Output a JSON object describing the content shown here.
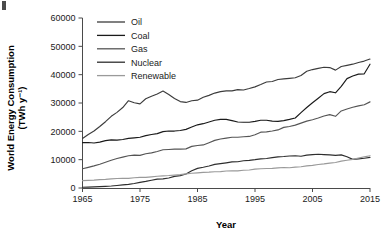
{
  "chart_data": {
    "type": "line",
    "title": "",
    "xlabel": "Year",
    "ylabel": "World Energy Consumption (TWh y⁻¹)",
    "ylabel_line1": "World Energy Consumption",
    "ylabel_line2": "(TWh y⁻¹)",
    "xlim": [
      1965,
      2015
    ],
    "ylim": [
      0,
      60000
    ],
    "xticks": [
      1965,
      1975,
      1985,
      1995,
      2005,
      2015
    ],
    "xtick_labels": [
      "1965",
      "1975",
      "1985",
      "1995",
      "2005",
      "2015"
    ],
    "yticks": [
      0,
      10000,
      20000,
      30000,
      40000,
      50000,
      60000
    ],
    "ytick_labels": [
      "0",
      "10000",
      "20000",
      "30000",
      "40000",
      "50000",
      "60000"
    ],
    "grid": false,
    "legend_position": "top-left-inside",
    "x": [
      1965,
      1966,
      1967,
      1968,
      1969,
      1970,
      1971,
      1972,
      1973,
      1974,
      1975,
      1976,
      1977,
      1978,
      1979,
      1980,
      1981,
      1982,
      1983,
      1984,
      1985,
      1986,
      1987,
      1988,
      1989,
      1990,
      1991,
      1992,
      1993,
      1994,
      1995,
      1996,
      1997,
      1998,
      1999,
      2000,
      2001,
      2002,
      2003,
      2004,
      2005,
      2006,
      2007,
      2008,
      2009,
      2010,
      2011,
      2012,
      2013,
      2014,
      2015
    ],
    "series": [
      {
        "name": "Oil",
        "color": "#3c3c3c",
        "values": [
          17500,
          18900,
          20100,
          21700,
          23400,
          25300,
          26700,
          28400,
          30800,
          30100,
          29700,
          31500,
          32400,
          33200,
          34200,
          33000,
          31600,
          30500,
          30200,
          30800,
          31000,
          32000,
          32700,
          33500,
          34000,
          34300,
          34300,
          34700,
          34600,
          35100,
          35700,
          36500,
          37400,
          37600,
          38300,
          38500,
          38700,
          38900,
          39700,
          41200,
          41800,
          42200,
          42600,
          42500,
          41600,
          42900,
          43300,
          43700,
          44300,
          44800,
          45500
        ]
      },
      {
        "name": "Coal",
        "color": "#1a1a1a",
        "values": [
          16000,
          16050,
          15900,
          16200,
          16700,
          17000,
          16900,
          17100,
          17500,
          17700,
          17900,
          18500,
          18900,
          19200,
          19900,
          20100,
          20100,
          20300,
          20700,
          21500,
          22300,
          22700,
          23300,
          23900,
          24200,
          24200,
          23800,
          23300,
          23200,
          23200,
          23500,
          23900,
          23900,
          23600,
          23500,
          23800,
          24200,
          24700,
          26600,
          28400,
          30100,
          31700,
          33300,
          34000,
          33600,
          35900,
          38600,
          39500,
          40200,
          40300,
          43700
        ]
      },
      {
        "name": "Gas",
        "color": "#555555",
        "values": [
          6800,
          7300,
          7800,
          8400,
          9100,
          9800,
          10400,
          10900,
          11400,
          11600,
          11500,
          12100,
          12400,
          12900,
          13500,
          13600,
          13700,
          13700,
          13800,
          14700,
          15000,
          15200,
          16000,
          16800,
          17300,
          17600,
          17900,
          17900,
          18100,
          18200,
          18800,
          19700,
          19800,
          20100,
          20500,
          21400,
          21700,
          22200,
          22900,
          23600,
          24100,
          24700,
          25400,
          25900,
          25300,
          27200,
          27900,
          28500,
          29000,
          29400,
          30400
        ]
      },
      {
        "name": "Nuclear",
        "color": "#2e2e2e",
        "values": [
          280,
          330,
          390,
          470,
          570,
          700,
          870,
          1080,
          1270,
          1570,
          2000,
          2320,
          2740,
          3130,
          3240,
          3530,
          4110,
          4380,
          4960,
          6080,
          6930,
          7310,
          7770,
          8350,
          8600,
          8880,
          9200,
          9280,
          9620,
          9760,
          10000,
          10300,
          10400,
          10700,
          11000,
          11100,
          11300,
          11400,
          11200,
          11600,
          11800,
          11900,
          11800,
          11700,
          11500,
          11700,
          11000,
          10100,
          10300,
          10500,
          10800
        ]
      },
      {
        "name": "Renewable",
        "color": "#9a9a9a",
        "values": [
          2600,
          2700,
          2800,
          2950,
          3050,
          3200,
          3350,
          3450,
          3400,
          3600,
          3750,
          3750,
          3950,
          4150,
          4300,
          4400,
          4550,
          4700,
          5000,
          5200,
          5350,
          5500,
          5600,
          5750,
          5800,
          6000,
          6100,
          6050,
          6250,
          6350,
          6650,
          6800,
          6900,
          6950,
          7100,
          7250,
          7150,
          7350,
          7500,
          7800,
          8000,
          8300,
          8500,
          8800,
          9000,
          9500,
          9800,
          10100,
          10600,
          11000,
          11400
        ]
      }
    ]
  },
  "legend": {
    "items": [
      {
        "label": "Oil"
      },
      {
        "label": "Coal"
      },
      {
        "label": "Gas"
      },
      {
        "label": "Nuclear"
      },
      {
        "label": "Renewable"
      }
    ]
  }
}
